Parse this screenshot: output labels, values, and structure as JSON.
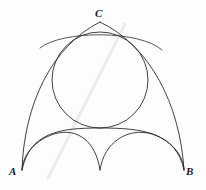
{
  "figure": {
    "background_color": "#fdfdfd",
    "ink_color": "#2b2b2b",
    "artifact_color": "#e8e8e4",
    "labels": {
      "a": "A",
      "b": "B",
      "c": "C"
    },
    "vertices": {
      "a": {
        "x": 22,
        "y": 170
      },
      "b": {
        "x": 184,
        "y": 170
      },
      "c": {
        "x": 100,
        "y": 22
      }
    },
    "inscribed_circle": {
      "name": "inscribed-circle",
      "cx": 100,
      "cy": 80,
      "r": 48,
      "stroke": "#2b2b2b",
      "stroke_width": 0.9
    },
    "outer_arcs": [
      {
        "name": "arc-A-to-C",
        "from": "A",
        "to": "C",
        "d": "M 22 170 C 24 104 52 46 100 22",
        "stroke": "#2b2b2b",
        "stroke_width": 0.9
      },
      {
        "name": "arc-C-to-B",
        "from": "C",
        "to": "B",
        "d": "M 100 22 C 150 46 180 104 184 170",
        "stroke": "#2b2b2b",
        "stroke_width": 0.9
      },
      {
        "name": "arc-chord-A-to-B-upper",
        "from": "A",
        "to": "B",
        "d": "M 22 170 C 30 132 60 128 100 128 C 142 128 176 132 184 170",
        "stroke": "#2b2b2b",
        "stroke_width": 0.9
      }
    ],
    "cusp_arcs": [
      {
        "name": "cusp-arc-left",
        "d": "M 22 170 C 22 160 30 142 54 134 C 78 127 96 142 100 170",
        "stroke": "#2b2b2b",
        "stroke_width": 0.9
      },
      {
        "name": "cusp-arc-right",
        "d": "M 184 170 C 184 160 176 142 152 134 C 128 127 104 142 100 170",
        "stroke": "#2b2b2b",
        "stroke_width": 0.9
      }
    ],
    "tangent_chord": {
      "name": "tangent-chord-top",
      "d": "M 40 48 C 62 30 140 30 162 50",
      "stroke": "#2b2b2b",
      "stroke_width": 0.8
    },
    "scan_artifact": {
      "name": "diagonal-scan-streak",
      "d": "M 48 178 L 125 24",
      "stroke": "#ececea",
      "stroke_width": 3.2
    }
  }
}
